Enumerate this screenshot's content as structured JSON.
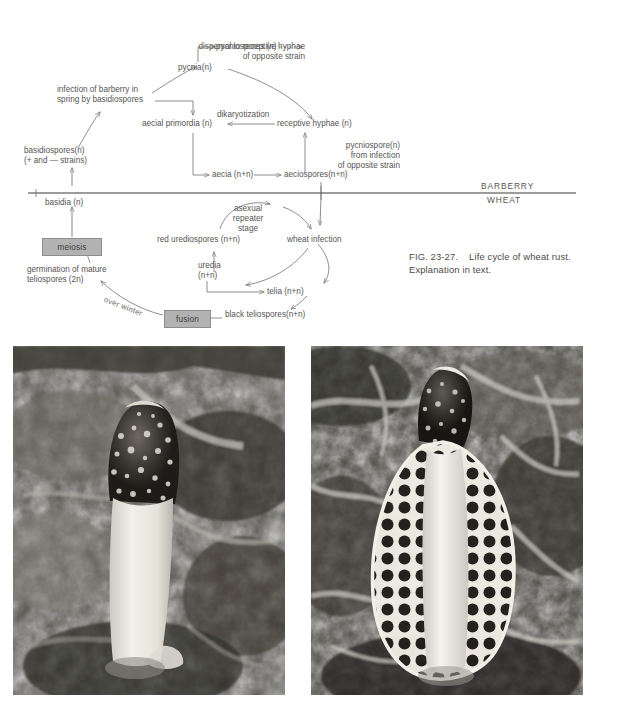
{
  "figure": {
    "caption_id": "FIG. 23-27.",
    "caption_text": "Life cycle of wheat rust. Explanation in text."
  },
  "diagram": {
    "title": "Life cycle of wheat rust",
    "divider_labels": {
      "upper": "BARBERRY",
      "lower": "WHEAT"
    },
    "nodes": [
      {
        "id": "pycniospores",
        "label": "pycniospores (n)"
      },
      {
        "id": "dispersal",
        "label": "dispersal to receptive hyphae\nof opposite strain"
      },
      {
        "id": "pycnia",
        "label": "pycnia(n)"
      },
      {
        "id": "infection-barberry",
        "label": "infection of barberry in\nspring by basidiospores"
      },
      {
        "id": "dikaryotization",
        "label": "dikaryotization"
      },
      {
        "id": "aecial-primordia",
        "label": "aecial primordia (n)"
      },
      {
        "id": "receptive-hyphae",
        "label": "receptive hyphae (n)"
      },
      {
        "id": "pycniospore-opposite",
        "label": "pycniospore(n)\nfrom infection\nof opposite strain"
      },
      {
        "id": "basidiospores",
        "label": "basidiospores(n)\n(+ and — strains)"
      },
      {
        "id": "aecia",
        "label": "aecia (n+n)"
      },
      {
        "id": "aeciospores",
        "label": "aeciospores(n+n)"
      },
      {
        "id": "basidia",
        "label": "basidia (n)"
      },
      {
        "id": "asexual-repeater",
        "label": "asexual\nrepeater\nstage"
      },
      {
        "id": "meiosis",
        "label": "meiosis"
      },
      {
        "id": "red-urediospores",
        "label": "red urediospores (n+n)"
      },
      {
        "id": "wheat-infection",
        "label": "wheat infection"
      },
      {
        "id": "uredia",
        "label": "uredia\n(n+n)"
      },
      {
        "id": "germination",
        "label": "germination of mature\nteliospores (2n)"
      },
      {
        "id": "telia",
        "label": "telia (n+n)"
      },
      {
        "id": "over-winter",
        "label": "over winter"
      },
      {
        "id": "fusion",
        "label": "fusion"
      },
      {
        "id": "black-teliospores",
        "label": "black teliospores(n+n)"
      }
    ],
    "shaded_boxes": [
      "meiosis",
      "fusion"
    ],
    "colors": {
      "box_fill": "#b2b2b2",
      "line": "#7a7a7a",
      "text": "#555555"
    }
  },
  "photos": [
    {
      "id": "photo-left",
      "subject": "stinkhorn fungus with dark spore-covered cap on white stalk among fallen leaves"
    },
    {
      "id": "photo-right",
      "subject": "veiled stinkhorn with lacy net-like indusium skirt among grass and litter"
    }
  ]
}
